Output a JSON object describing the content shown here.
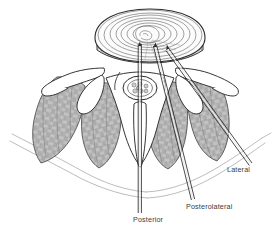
{
  "figure": {
    "view": "axial cross-section",
    "style": "grayscale medical line illustration with stippled muscle shading",
    "width": 273,
    "height": 231,
    "background_color": "#ffffff",
    "ink_color": "#2b2b2b",
    "muscle_fill_color": "#b9b9b9",
    "muscle_outline_color": "#6e6e6e",
    "bone_fill_color": "#ffffff",
    "disc_fill_color": "#fbfbfb",
    "label_color": "#3b3b3b"
  },
  "labels": [
    {
      "id": "posterior",
      "text": "Posterior",
      "x": 133,
      "y": 216,
      "leader": {
        "from_x": 140,
        "from_y": 213,
        "to_x": 140,
        "to_y": 60
      },
      "approach_angle_deg": 0
    },
    {
      "id": "posterolateral",
      "text": "Posterolateral",
      "x": 186,
      "y": 203,
      "leader": {
        "from_x": 193,
        "from_y": 200,
        "to_x": 155,
        "to_y": 62
      },
      "approach_angle_deg": 15
    },
    {
      "id": "lateral",
      "text": "Lateral",
      "x": 227,
      "y": 166,
      "leader": {
        "from_x": 251,
        "from_y": 166,
        "to_x": 169,
        "to_y": 62
      },
      "approach_angle_deg": 38
    }
  ],
  "structures": [
    {
      "name": "intervertebral-disc",
      "note": "concentric annulus fibrosus lamellae, superior surface"
    },
    {
      "name": "nucleus-pulposus",
      "note": "central target where needle tips converge"
    },
    {
      "name": "vertebral-body",
      "note": "anterior bony block beneath disc"
    },
    {
      "name": "spinal-canal",
      "note": "contains cauda equina nerve roots"
    },
    {
      "name": "cauda-equina",
      "note": "clustered nerve roots in thecal sac"
    },
    {
      "name": "spinous-process",
      "note": "midline posterior bony projection"
    },
    {
      "name": "transverse-process-left",
      "note": "lateral bony wing, left"
    },
    {
      "name": "transverse-process-right",
      "note": "lateral bony wing, right"
    },
    {
      "name": "superior-articular-process-left",
      "note": "facet joint process, left"
    },
    {
      "name": "superior-articular-process-right",
      "note": "facet joint process, right"
    },
    {
      "name": "paraspinal-muscle-left",
      "note": "erector spinae / multifidus bundle, left"
    },
    {
      "name": "paraspinal-muscle-right",
      "note": "erector spinae / multifidus bundle, right"
    },
    {
      "name": "skin-fascia-contour",
      "note": "thin outer body surface lines"
    }
  ],
  "needles": [
    {
      "id": "posterior-needle",
      "shaft": "vertical hollow double-line",
      "entry": "midline posterior"
    },
    {
      "id": "posterolateral-needle",
      "shaft": "oblique hollow double-line",
      "entry": "paramedian posterolateral"
    },
    {
      "id": "lateral-needle",
      "shaft": "steeply oblique hollow double-line",
      "entry": "far lateral flank"
    }
  ]
}
